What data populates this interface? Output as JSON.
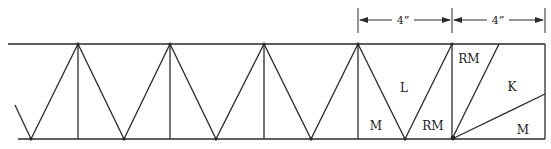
{
  "diagram": {
    "type": "truss-panel-diagram",
    "dimensions": [
      {
        "label": "4”",
        "from_x": 358,
        "to_x": 452
      },
      {
        "label": "4”",
        "from_x": 452,
        "to_x": 545
      }
    ],
    "regions": [
      {
        "label": "L",
        "x": 404,
        "y": 88
      },
      {
        "label": "M",
        "x": 376,
        "y": 126
      },
      {
        "label": "RM",
        "x": 433,
        "y": 126
      },
      {
        "label": "RM",
        "x": 469,
        "y": 63
      },
      {
        "label": "K",
        "x": 512,
        "y": 87
      },
      {
        "label": "M",
        "x": 523,
        "y": 130
      }
    ],
    "colors": {
      "line": "#2a2a2a",
      "background": "#ffffff"
    }
  }
}
